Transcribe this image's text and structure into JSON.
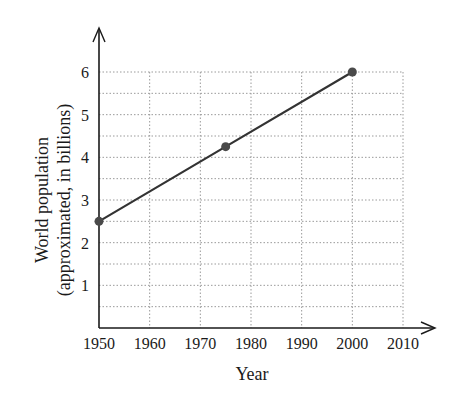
{
  "chart_data": {
    "type": "line",
    "title": "",
    "xlabel": "Year",
    "ylabel_line1": "World population",
    "ylabel_line2": "(approximated, in billions)",
    "x": [
      1950,
      1975,
      2000
    ],
    "series": [
      {
        "name": "World population",
        "values": [
          2.5,
          4.25,
          6
        ]
      }
    ],
    "xlim": [
      1950,
      2010
    ],
    "ylim": [
      0,
      6
    ],
    "x_ticks": [
      "1950",
      "1960",
      "1970",
      "1980",
      "1990",
      "2000",
      "2010"
    ],
    "y_ticks": [
      "1",
      "2",
      "3",
      "4",
      "5",
      "6"
    ],
    "grid": true,
    "grid_style": "dotted",
    "minor_y_step": 0.5,
    "legend": "none",
    "markers": true
  },
  "colors": {
    "line": "#333333",
    "marker": "#4a4a4a",
    "grid": "#9a9a9a",
    "axis": "#1a1a1a"
  }
}
